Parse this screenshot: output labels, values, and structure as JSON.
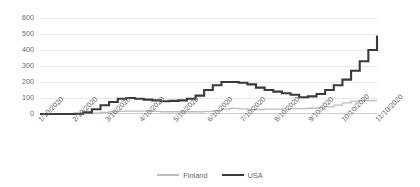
{
  "chart_data": {
    "type": "line",
    "title": "",
    "subtitle": "",
    "xlabel": "",
    "ylabel": "",
    "ylim": [
      0,
      600
    ],
    "yticks": [
      0,
      100,
      200,
      300,
      400,
      500,
      600
    ],
    "ytick_labels": [
      "0",
      "100",
      "200",
      "300",
      "400",
      "500",
      "600"
    ],
    "grid": true,
    "grid_axis": "y",
    "legend_position": "bottom-center",
    "xtick_labels": [
      "1/10/2020",
      "2/10/2020",
      "3/10/2020",
      "4/10/2020",
      "5/10/2020",
      "6/10/2020",
      "7/10/2020",
      "8/10/2020",
      "9/10/2020",
      "10/10/2020",
      "11/10/2020"
    ],
    "x": [
      "1/10/2020",
      "1/25/2020",
      "2/10/2020",
      "2/25/2020",
      "3/10/2020",
      "3/20/2020",
      "3/28/2020",
      "4/02/2020",
      "4/10/2020",
      "4/18/2020",
      "4/25/2020",
      "5/02/2020",
      "5/10/2020",
      "5/20/2020",
      "5/28/2020",
      "6/05/2020",
      "6/10/2020",
      "6/18/2020",
      "6/25/2020",
      "7/02/2020",
      "7/10/2020",
      "7/18/2020",
      "7/25/2020",
      "8/02/2020",
      "8/10/2020",
      "8/18/2020",
      "8/25/2020",
      "9/02/2020",
      "9/10/2020",
      "9/18/2020",
      "9/25/2020",
      "10/02/2020",
      "10/10/2020",
      "10/18/2020",
      "10/25/2020",
      "11/02/2020",
      "11/10/2020",
      "11/18/2020",
      "11/25/2020",
      "12/02/2020"
    ],
    "series": [
      {
        "name": "Finland",
        "color": "#bdbdbd",
        "style": "thin-line",
        "values": [
          0,
          0,
          0,
          0,
          0,
          2,
          6,
          10,
          14,
          16,
          18,
          18,
          18,
          16,
          14,
          14,
          14,
          14,
          14,
          16,
          20,
          30,
          35,
          32,
          28,
          28,
          30,
          30,
          32,
          34,
          34,
          36,
          38,
          45,
          55,
          70,
          80,
          85,
          84,
          84
        ]
      },
      {
        "name": "USA",
        "color": "#3a3a3a",
        "style": "thick-line",
        "values": [
          0,
          0,
          0,
          0,
          2,
          10,
          30,
          55,
          75,
          95,
          100,
          95,
          90,
          85,
          80,
          82,
          85,
          95,
          115,
          150,
          180,
          200,
          200,
          195,
          185,
          165,
          150,
          140,
          130,
          120,
          105,
          110,
          125,
          150,
          180,
          215,
          270,
          330,
          400,
          490
        ]
      }
    ]
  },
  "legend": {
    "items": [
      {
        "label": "Finland",
        "swatch": "finland-line-swatch"
      },
      {
        "label": "USA",
        "swatch": "usa-line-swatch"
      }
    ]
  }
}
